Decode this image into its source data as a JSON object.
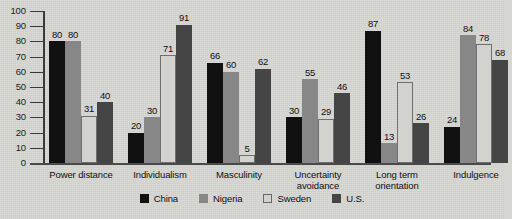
{
  "chart_data": {
    "type": "bar",
    "title": "",
    "xlabel": "",
    "ylabel": "",
    "ylim": [
      0,
      100
    ],
    "yticks": [
      0,
      10,
      20,
      30,
      40,
      50,
      60,
      70,
      80,
      90,
      100
    ],
    "grid": false,
    "legend_position": "bottom",
    "categories": [
      "Power distance",
      "Individualism",
      "Masculinity",
      "Uncertainty\navoidance",
      "Long term\norientation",
      "Indulgence"
    ],
    "series": [
      {
        "name": "China",
        "color": "#111111",
        "values": [
          80,
          20,
          66,
          30,
          87,
          24
        ]
      },
      {
        "name": "Nigeria",
        "color": "#878787",
        "values": [
          80,
          30,
          60,
          55,
          13,
          84
        ]
      },
      {
        "name": "Sweden",
        "color": "#d2d2ce",
        "values": [
          31,
          71,
          5,
          29,
          53,
          78
        ]
      },
      {
        "name": "U.S.",
        "color": "#454545",
        "values": [
          40,
          91,
          62,
          46,
          26,
          68
        ]
      }
    ]
  },
  "legend": {
    "items": [
      {
        "label": "China"
      },
      {
        "label": "Nigeria"
      },
      {
        "label": "Sweden"
      },
      {
        "label": "U.S."
      }
    ]
  }
}
